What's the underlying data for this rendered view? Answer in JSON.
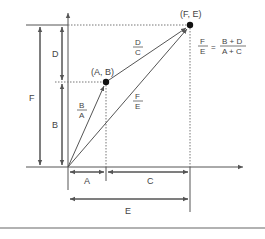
{
  "diagram": {
    "points": {
      "ab": {
        "label": "(A, B)"
      },
      "fe": {
        "label": "(F, E)"
      }
    },
    "dimensions": {
      "d": "D",
      "b": "B",
      "f": "F",
      "a": "A",
      "c": "C",
      "e": "E"
    },
    "slopes": {
      "ba": {
        "num": "B",
        "den": "A"
      },
      "dc": {
        "num": "D",
        "den": "C"
      },
      "fe": {
        "num": "F",
        "den": "E"
      }
    },
    "equation": {
      "lhs_num": "F",
      "lhs_den": "E",
      "equals": "=",
      "rhs_num": "B + D",
      "rhs_den": "A + C"
    },
    "colors": {
      "line": "#555555",
      "text": "#444444",
      "point": "#111111"
    }
  }
}
